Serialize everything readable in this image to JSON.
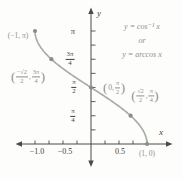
{
  "figure": {
    "title_line1": "y = cos⁻¹ x",
    "title_line2": "or",
    "title_line3": "y = arccos x"
  },
  "axes": {
    "x_label": "x",
    "y_label": "y",
    "x_tick_labels": {
      "neg1": "−1.0",
      "neg05": "−0.5",
      "pos05": "0.5"
    },
    "y_tick_labels": {
      "pi": "π",
      "three_pi_4": {
        "num": "3π",
        "den": "4"
      },
      "pi_2": {
        "num": "π",
        "den": "2"
      },
      "pi_4": {
        "num": "π",
        "den": "4"
      }
    }
  },
  "point_labels": {
    "p1": "(−1, π)",
    "p2": {
      "open": "(",
      "f1num": "−√2",
      "f1den": "2",
      "comma": ",",
      "f2num": "3π",
      "f2den": "4",
      "close": ")"
    },
    "p3": {
      "open": "(",
      "pre": "0,",
      "fnum": "π",
      "fden": "2",
      "close": ")"
    },
    "p4": {
      "open": "(",
      "f1num": "√2",
      "f1den": "2",
      "comma": ",",
      "f2num": "π",
      "f2den": "4",
      "close": ")"
    },
    "p5": "(1, 0)"
  },
  "colors": {
    "axis": "#4a4a47",
    "curve": "#a9aea7",
    "dot": "#878f88",
    "gray": "#8b918b",
    "dark": "#3f3f3d",
    "paper": "#fdfdfc"
  },
  "chart_data": {
    "type": "line",
    "title": "y = cos⁻¹ x  or  y = arccos x",
    "function": "y = arccos(x)",
    "x_domain": [
      -1,
      1
    ],
    "y_range": [
      0,
      3.1416
    ],
    "xlabel": "x",
    "ylabel": "y",
    "grid": false,
    "legend": null,
    "x_ticks": [
      -1,
      -0.75,
      -0.5,
      -0.25,
      0.25,
      0.5,
      0.75,
      1
    ],
    "x_tick_labels_shown": [
      "−1.0",
      "−0.5",
      "0.5"
    ],
    "y_ticks": [
      0.3927,
      0.7854,
      1.1781,
      1.5708,
      1.9635,
      2.3562,
      2.7489,
      3.1416
    ],
    "y_tick_labels_shown": [
      "π/4",
      "π/2",
      "3π/4",
      "π"
    ],
    "points": [
      {
        "x": -1,
        "y": 3.1416,
        "label": "(−1, π)"
      },
      {
        "x": -0.7071,
        "y": 2.3562,
        "label": "(−√2/2, 3π/4)"
      },
      {
        "x": 0,
        "y": 1.5708,
        "label": "(0, π/2)"
      },
      {
        "x": 0.7071,
        "y": 0.7854,
        "label": "(√2/2, π/4)"
      },
      {
        "x": 1,
        "y": 0,
        "label": "(1, 0)"
      }
    ]
  }
}
